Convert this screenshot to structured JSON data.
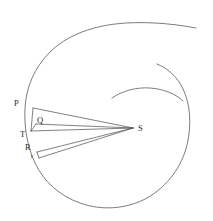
{
  "figure": {
    "background_color": "#ffffff",
    "curve_color": "#5b5b5b",
    "line_color": "#4a4a4a",
    "label_color": "#2b2b2b",
    "width": 213,
    "height": 221
  },
  "labels": {
    "P": "P",
    "Q": "Q",
    "T": "T",
    "R": "R",
    "r": "r",
    "S": "S"
  },
  "points": [
    {
      "name": "P",
      "label": "P",
      "x": 33,
      "y": 108,
      "label_x": 14,
      "label_y": 99
    },
    {
      "name": "Q",
      "label": "Q",
      "x": 36,
      "y": 124,
      "label_x": 37,
      "label_y": 116
    },
    {
      "name": "T",
      "label": "T",
      "x": 31,
      "y": 131,
      "label_x": 20,
      "label_y": 130
    },
    {
      "name": "R",
      "label": "R",
      "x": 37,
      "y": 152,
      "label_x": 25,
      "label_y": 143
    },
    {
      "name": "r",
      "label": "r",
      "x": 39,
      "y": 158,
      "label_x": 31,
      "label_y": 153
    },
    {
      "name": "S",
      "label": "S",
      "x": 133,
      "y": 128,
      "label_x": 138,
      "label_y": 124
    }
  ],
  "segments": [
    {
      "name": "SP",
      "from": "S",
      "to": "P"
    },
    {
      "name": "SQ",
      "from": "S",
      "to": "Q"
    },
    {
      "name": "ST",
      "from": "S",
      "to": "T"
    },
    {
      "name": "SR",
      "from": "S",
      "to": "R"
    },
    {
      "name": "Sr",
      "from": "S",
      "to": "r"
    },
    {
      "name": "PT",
      "from": "P",
      "to": "T"
    },
    {
      "name": "QT",
      "from": "Q",
      "to": "T"
    },
    {
      "name": "Rr",
      "from": "R",
      "to": "r"
    }
  ],
  "curves": {
    "outer_spiral": {
      "name": "outer-spiral-arc",
      "description": "Outer turn of the equiangular spiral sweeping counterclockwise from upper right around the left, bottom and right sides"
    },
    "inner_spiral": {
      "name": "inner-spiral-arc",
      "description": "Inner turn of the equiangular spiral, a short arc above and right of focus S"
    }
  }
}
